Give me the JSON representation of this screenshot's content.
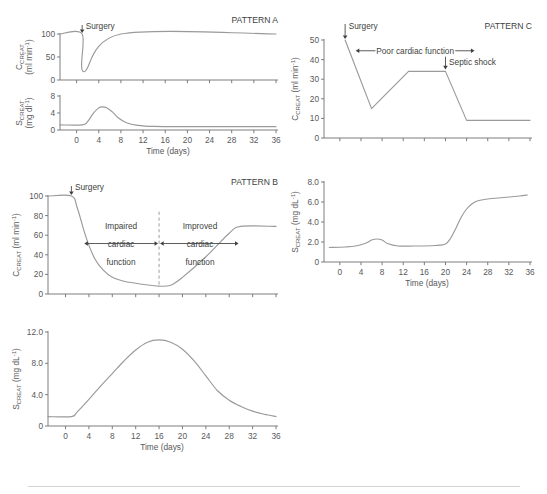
{
  "figure": {
    "axis_x_title": "Time (days)",
    "x_ticks": [
      0,
      4,
      8,
      12,
      16,
      20,
      24,
      28,
      32,
      36
    ],
    "pattern_a_label": "PATTERN A",
    "pattern_b_label": "PATTERN B",
    "pattern_c_label": "PATTERN C",
    "surgery_label": "Surgery",
    "septic_shock_label": "Septic shock",
    "poor_cardiac_label": "Poor cardiac function",
    "impaired_line1": "Impaired",
    "impaired_line2": "cardiac",
    "impaired_line3": "function",
    "improved_line1": "Improved",
    "improved_line2": "cardiac",
    "improved_line3": "function",
    "line_color": "#9a9a9c",
    "axis_color": "#6f6f71",
    "text_color": "#58585a"
  },
  "chart_data": [
    {
      "id": "pattern-a-ccreat",
      "type": "line",
      "title": "PATTERN A",
      "xlabel": "Time (days)",
      "ylabel": "C_creat (ml min^-1)",
      "ylabel_main": "C",
      "ylabel_sub": "CREAT",
      "ylabel_units": "(ml min",
      "ylabel_exp": "-1",
      "xlim": [
        -3,
        36
      ],
      "ylim": [
        0,
        100
      ],
      "y_ticks": [
        0,
        50,
        100
      ],
      "x_ticks": [
        0,
        4,
        8,
        12,
        16,
        20,
        24,
        28,
        32,
        36
      ],
      "annotations": [
        {
          "text": "Surgery",
          "x": 1,
          "y": 100
        }
      ],
      "x": [
        -3,
        1,
        1.35,
        8,
        36
      ],
      "values": [
        100,
        100,
        18,
        100,
        100
      ]
    },
    {
      "id": "pattern-a-screat",
      "type": "line",
      "title": "",
      "xlabel": "Time (days)",
      "ylabel": "S_creat (mg dl^-1)",
      "ylabel_main": "S",
      "ylabel_sub": "CREAT",
      "ylabel_units": "(mg dl",
      "ylabel_exp": "-1",
      "xlim": [
        -3,
        36
      ],
      "ylim": [
        0,
        8
      ],
      "y_ticks": [
        0,
        4,
        8
      ],
      "x_ticks": [
        0,
        4,
        8,
        12,
        16,
        20,
        24,
        28,
        32,
        36
      ],
      "annotations": [],
      "x": [
        -3,
        1,
        2,
        3,
        4,
        4.6,
        5.5,
        6.5,
        7.5,
        9,
        11,
        14,
        20,
        36
      ],
      "values": [
        1.2,
        1.2,
        2.0,
        3.9,
        5.2,
        5.45,
        5.2,
        4.2,
        2.9,
        1.7,
        1.1,
        0.85,
        0.8,
        0.8
      ]
    },
    {
      "id": "pattern-b-ccreat",
      "type": "line",
      "title": "PATTERN B",
      "xlabel": "Time (days)",
      "ylabel": "C_creat (ml min^-1)",
      "ylabel_main": "C",
      "ylabel_sub": "CREAT",
      "ylabel_units": "(ml min",
      "ylabel_exp": "-1",
      "xlim": [
        -3,
        36
      ],
      "ylim": [
        0,
        100
      ],
      "y_ticks": [
        0,
        20,
        40,
        60,
        80,
        100
      ],
      "x_ticks": [
        0,
        4,
        8,
        12,
        16,
        20,
        24,
        28,
        32,
        36
      ],
      "annotations": [
        {
          "text": "Surgery",
          "x": 1,
          "y": 100
        },
        {
          "text": "Impaired cardiac function",
          "x_from": 4,
          "x_to": 15
        },
        {
          "text": "Improved cardiac function",
          "x_from": 17,
          "x_to": 28
        }
      ],
      "divider_x": 16,
      "x": [
        -3,
        1,
        2,
        3.5,
        5,
        6.5,
        8,
        10,
        13,
        16,
        18,
        20,
        24,
        28,
        30,
        36
      ],
      "values": [
        100,
        100,
        88,
        58,
        36,
        24,
        17,
        13,
        10,
        8,
        9,
        17,
        38,
        62,
        69,
        69
      ]
    },
    {
      "id": "pattern-b-screat",
      "type": "line",
      "title": "",
      "xlabel": "Time (days)",
      "ylabel": "S_creat (mg dL^-1)",
      "ylabel_main": "S",
      "ylabel_sub": "CREAT",
      "ylabel_units": "(mg dL",
      "ylabel_exp": "-1",
      "xlim": [
        -3,
        36
      ],
      "ylim": [
        0,
        12
      ],
      "y_ticks": [
        0,
        4.0,
        8.0,
        12.0
      ],
      "y_tick_labels": [
        "0",
        "4.0",
        "8.0",
        "12.0"
      ],
      "x_ticks": [
        0,
        4,
        8,
        12,
        16,
        20,
        24,
        28,
        32,
        36
      ],
      "annotations": [],
      "x": [
        -3,
        1,
        2,
        4,
        6,
        8,
        10,
        12,
        14,
        16,
        18,
        20,
        22,
        24,
        26,
        28,
        30,
        32,
        34,
        36
      ],
      "values": [
        1.2,
        1.2,
        1.8,
        3.4,
        5.1,
        6.7,
        8.3,
        9.7,
        10.7,
        11.0,
        10.7,
        9.8,
        8.3,
        6.4,
        4.5,
        3.3,
        2.5,
        1.9,
        1.5,
        1.2
      ]
    },
    {
      "id": "pattern-c-ccreat",
      "type": "line",
      "title": "PATTERN C",
      "xlabel": "Time (days)",
      "ylabel": "C_creat (ml min^-1)",
      "ylabel_main": "C",
      "ylabel_sub": "CREAT",
      "ylabel_units": "(ml min",
      "ylabel_exp": "-1",
      "xlim": [
        -3,
        36
      ],
      "ylim": [
        0,
        50
      ],
      "y_ticks": [
        0,
        10,
        20,
        30,
        40,
        50
      ],
      "x_ticks": [
        0,
        4,
        8,
        12,
        16,
        20,
        24,
        28,
        32,
        36
      ],
      "annotations": [
        {
          "text": "Surgery",
          "x": 1,
          "y": 50
        },
        {
          "text": "Poor cardiac function",
          "x_from": 3,
          "x_to": 24
        },
        {
          "text": "Septic shock",
          "x": 20,
          "y": 40
        }
      ],
      "x": [
        1,
        6,
        13,
        20,
        24,
        36
      ],
      "values": [
        50,
        15,
        34,
        34,
        9,
        9
      ]
    },
    {
      "id": "pattern-c-screat",
      "type": "line",
      "title": "",
      "xlabel": "Time (days)",
      "ylabel": "S_creat (mg dL^-1)",
      "ylabel_main": "S",
      "ylabel_sub": "CREAT",
      "ylabel_units": "(mg dL",
      "ylabel_exp": "-1",
      "xlim": [
        -3,
        36
      ],
      "ylim": [
        0,
        8
      ],
      "y_ticks": [
        0,
        2.0,
        4.0,
        6.0,
        8.0
      ],
      "y_tick_labels": [
        "0",
        "2.0",
        "4.0",
        "6.0",
        "8.0"
      ],
      "x_ticks": [
        0,
        4,
        8,
        12,
        16,
        20,
        24,
        28,
        32,
        36
      ],
      "annotations": [],
      "x": [
        -2,
        1,
        3,
        5,
        6,
        7,
        8,
        9,
        11,
        14,
        18,
        20,
        21,
        22,
        23,
        24,
        25,
        26,
        28,
        31,
        34,
        35.5
      ],
      "values": [
        1.45,
        1.5,
        1.6,
        1.9,
        2.2,
        2.3,
        2.2,
        1.85,
        1.6,
        1.6,
        1.65,
        1.8,
        2.4,
        3.4,
        4.5,
        5.3,
        5.8,
        6.1,
        6.3,
        6.45,
        6.6,
        6.7
      ]
    }
  ]
}
